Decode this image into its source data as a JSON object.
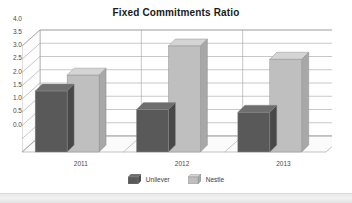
{
  "chart_data": {
    "type": "bar",
    "title": "Fixed Commitments Ratio",
    "xlabel": "",
    "ylabel": "",
    "categories": [
      "2011",
      "2012",
      "2013"
    ],
    "series": [
      {
        "name": "Unilever",
        "color": "#595959",
        "values": [
          2.3,
          1.6,
          1.5
        ]
      },
      {
        "name": "Nestle",
        "color": "#bfbfbf",
        "values": [
          2.9,
          4.0,
          3.5
        ]
      }
    ],
    "ylim": [
      0.0,
      4.0
    ],
    "ytick_step": 0.5,
    "ytick_labels": [
      "4.0",
      "3.5",
      "3.0",
      "2.5",
      "2.0",
      "1.5",
      "1.0",
      "0.5",
      "0.0"
    ],
    "grid": true,
    "legend_position": "bottom",
    "style": "3d-column"
  },
  "legend": {
    "items": [
      {
        "label": "Unilever",
        "swatch": "legend-swatch-unilever"
      },
      {
        "label": "Nestle",
        "swatch": "legend-swatch-nestle"
      }
    ]
  },
  "colors": {
    "unilever_front": "#595959",
    "unilever_top": "#6e6e6e",
    "unilever_side": "#484848",
    "nestle_front": "#bfbfbf",
    "nestle_top": "#d4d4d4",
    "nestle_side": "#a8a8a8",
    "gridline": "#9a9a9a",
    "wall": "#ffffff",
    "floor": "#fbfbfb",
    "page_strip": "#eeeeee"
  }
}
